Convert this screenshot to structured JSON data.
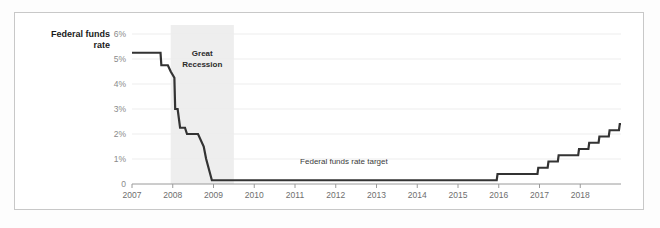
{
  "chart_data": {
    "type": "line",
    "title": "Federal funds rate",
    "title_line1": "Federal funds",
    "title_line2": "rate",
    "xlabel": "",
    "ylabel": "",
    "xlim": [
      2007.0,
      2019.0
    ],
    "ylim": [
      0,
      6
    ],
    "grid": true,
    "legend": "none",
    "y_ticks": [
      0,
      1,
      2,
      3,
      4,
      5,
      6
    ],
    "y_tick_labels": [
      "0",
      "1%",
      "2%",
      "3%",
      "4%",
      "5%",
      "6%"
    ],
    "x_ticks": [
      2007,
      2008,
      2009,
      2010,
      2011,
      2012,
      2013,
      2014,
      2015,
      2016,
      2017,
      2018
    ],
    "x_tick_labels": [
      "2007",
      "2008",
      "2009",
      "2010",
      "2011",
      "2012",
      "2013",
      "2014",
      "2015",
      "2016",
      "2017",
      "2018"
    ],
    "series": [
      {
        "name": "Federal funds rate target",
        "color": "#333333",
        "points": [
          [
            2007.0,
            5.25
          ],
          [
            2007.7,
            5.25
          ],
          [
            2007.72,
            4.75
          ],
          [
            2007.88,
            4.75
          ],
          [
            2007.95,
            4.5
          ],
          [
            2008.04,
            4.25
          ],
          [
            2008.06,
            3.0
          ],
          [
            2008.12,
            3.0
          ],
          [
            2008.18,
            2.25
          ],
          [
            2008.3,
            2.25
          ],
          [
            2008.35,
            2.0
          ],
          [
            2008.62,
            2.0
          ],
          [
            2008.76,
            1.5
          ],
          [
            2008.82,
            1.0
          ],
          [
            2008.96,
            0.15
          ],
          [
            2015.95,
            0.15
          ],
          [
            2015.97,
            0.4
          ],
          [
            2016.95,
            0.4
          ],
          [
            2016.97,
            0.65
          ],
          [
            2017.2,
            0.65
          ],
          [
            2017.22,
            0.9
          ],
          [
            2017.45,
            0.9
          ],
          [
            2017.47,
            1.15
          ],
          [
            2017.95,
            1.15
          ],
          [
            2017.97,
            1.4
          ],
          [
            2018.2,
            1.4
          ],
          [
            2018.22,
            1.65
          ],
          [
            2018.45,
            1.65
          ],
          [
            2018.47,
            1.9
          ],
          [
            2018.7,
            1.9
          ],
          [
            2018.72,
            2.15
          ],
          [
            2018.95,
            2.15
          ],
          [
            2018.97,
            2.4
          ],
          [
            2019.0,
            2.4
          ]
        ]
      }
    ],
    "annotations": [
      {
        "name": "series-label",
        "text": "Federal funds rate target",
        "x": 2012.2,
        "y": 0.82
      }
    ],
    "shaded_regions": [
      {
        "name": "Great Recession",
        "label_line1": "Great",
        "label_line2": "Recession",
        "x_start": 2007.95,
        "x_end": 2009.5,
        "color": "#eeeeee"
      }
    ],
    "colors": {
      "line": "#333333",
      "grid": "#ededed",
      "axis": "#9a9a9a",
      "y_tick_text": "#8a8a8a",
      "x_tick_text": "#6e6e6e",
      "title_text": "#1a1a1a",
      "band_fill": "#eeeeee",
      "band_text": "#2b2b2b",
      "annotation_text": "#3a3a3a",
      "frame": "#c8c8c8",
      "background": "#ffffff"
    }
  }
}
